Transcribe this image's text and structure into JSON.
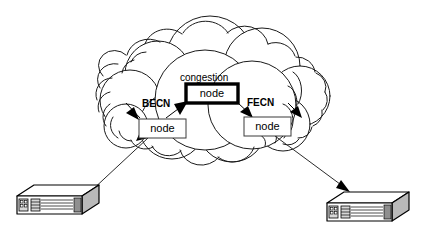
{
  "diagram": {
    "type": "network-diagram",
    "background_color": "#ffffff",
    "stroke_color": "#000000",
    "cloud": {
      "name": "network-cloud",
      "label": ""
    },
    "nodes": [
      {
        "id": "congestion-node",
        "label": "node",
        "caption": "congestion",
        "emphasis": "thick-border",
        "x": 186,
        "y": 84,
        "width": 52,
        "height": 19
      },
      {
        "id": "left-node",
        "label": "node",
        "caption": "",
        "emphasis": "normal",
        "x": 139,
        "y": 119,
        "width": 47,
        "height": 19
      },
      {
        "id": "right-node",
        "label": "node",
        "caption": "",
        "emphasis": "normal",
        "x": 244,
        "y": 117,
        "width": 47,
        "height": 19
      }
    ],
    "annotations": [
      {
        "id": "becn-label",
        "text": "BECN",
        "x": 142,
        "y": 106,
        "bold": true
      },
      {
        "id": "fecn-label",
        "text": "FECN",
        "x": 247,
        "y": 105,
        "bold": true
      },
      {
        "id": "congestion-caption",
        "text": "congestion",
        "x": 180,
        "y": 81,
        "bold": false
      }
    ],
    "devices": [
      {
        "id": "left-device",
        "name": "left-router",
        "label": ""
      },
      {
        "id": "right-device",
        "name": "right-router",
        "label": ""
      }
    ],
    "flows": [
      {
        "id": "becn-inner",
        "from": "left-node",
        "to": "congestion-node",
        "label": "BECN"
      },
      {
        "id": "becn-outer",
        "from": "left-node",
        "to": "upstream",
        "label": "BECN"
      },
      {
        "id": "fecn-inner",
        "from": "congestion-node",
        "to": "right-node",
        "label": "FECN"
      },
      {
        "id": "fecn-outer",
        "from": "right-node",
        "to": "downstream",
        "label": "FECN"
      }
    ]
  }
}
